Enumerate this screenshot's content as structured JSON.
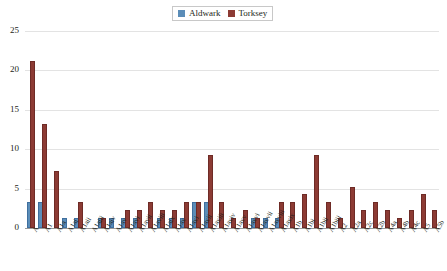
{
  "legend": {
    "position": "top-center",
    "items": [
      {
        "label": "Aldwark",
        "color": "#5b8db8",
        "swatch_name": "legend-swatch-aldwark"
      },
      {
        "label": "Torksey",
        "color": "#8c3b34",
        "swatch_name": "legend-swatch-torksey"
      }
    ]
  },
  "chart_data": {
    "type": "bar",
    "title": "",
    "subtitle": "",
    "xlabel": "",
    "ylabel": "",
    "ylim": [
      0,
      25
    ],
    "yticks": [
      0,
      5,
      10,
      15,
      20,
      25
    ],
    "grid": true,
    "legend_position": "top-center",
    "categories": [
      "A",
      "A1",
      "A1a",
      "A1ai",
      "A1aii",
      "A1aiii",
      "A1aiv",
      "A1av",
      "A1avi",
      "A1avii",
      "A1aviii",
      "A1aix",
      "A1ax",
      "A1axi",
      "A1axii",
      "A1axiii",
      "A1axiv",
      "A1axv",
      "A1axvi",
      "A1axvii",
      "A1axviii",
      "A1axix",
      "A1b",
      "A1bi",
      "A1bii",
      "A1biii",
      "A2",
      "A2a",
      "A2c",
      "A2b",
      "A4a",
      "A4b",
      "A4c",
      "A5",
      "A5b"
    ],
    "series": [
      {
        "name": "Aldwark",
        "color": "#5b8db8",
        "values": [
          3,
          3,
          0,
          1,
          1,
          0,
          1,
          1,
          1,
          1,
          0,
          1,
          1,
          1,
          3,
          3,
          0,
          0,
          0,
          1,
          1,
          1,
          0,
          0,
          0,
          0,
          0,
          0,
          0,
          0,
          0,
          0,
          0,
          0,
          0
        ]
      },
      {
        "name": "Torksey",
        "color": "#8c3b34",
        "values": [
          21,
          13,
          7,
          0,
          3,
          0,
          1,
          0,
          2,
          2,
          3,
          2,
          2,
          3,
          3,
          9,
          3,
          1,
          2,
          1,
          0,
          3,
          3,
          4,
          9,
          3,
          1,
          5,
          2,
          3,
          2,
          1,
          2,
          4,
          2
        ]
      }
    ]
  }
}
